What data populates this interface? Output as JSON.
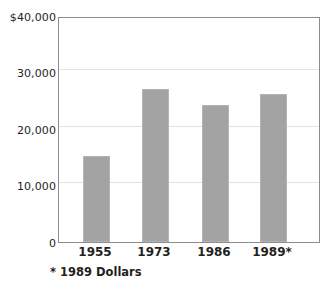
{
  "chart_data": {
    "type": "bar",
    "title": "",
    "xlabel": "",
    "ylabel": "",
    "categories": [
      "1955",
      "1973",
      "1986",
      "1989*"
    ],
    "values": [
      15400,
      27400,
      24400,
      26400
    ],
    "ylim": [
      0,
      40000
    ],
    "ytick_values": [
      0,
      10000,
      20000,
      30000,
      40000
    ],
    "ytick_labels": [
      "0",
      "10,000",
      "20,000",
      "30,000",
      "$40,000"
    ],
    "grid": true,
    "legend": "none",
    "annotations": [
      "* 1989 Dollars"
    ],
    "bar_color": "#a3a3a3",
    "frame_color": "#8c8c8c",
    "gridline_color": "#e3e3e3"
  },
  "axes": {
    "y_ticks": [
      {
        "label": "$40,000",
        "value": 40000
      },
      {
        "label": "30,000",
        "value": 30000
      },
      {
        "label": "20,000",
        "value": 20000
      },
      {
        "label": "10,000",
        "value": 10000
      },
      {
        "label": "0",
        "value": 0
      }
    ],
    "x_ticks": [
      {
        "label": "1955"
      },
      {
        "label": "1973"
      },
      {
        "label": "1986"
      },
      {
        "label": "1989*"
      }
    ]
  },
  "bars": [
    {
      "category": "1955",
      "value": 15400
    },
    {
      "category": "1973",
      "value": 27400
    },
    {
      "category": "1986",
      "value": 24400
    },
    {
      "category": "1989*",
      "value": 26400
    }
  ],
  "footnote": {
    "text": "* 1989 Dollars"
  }
}
